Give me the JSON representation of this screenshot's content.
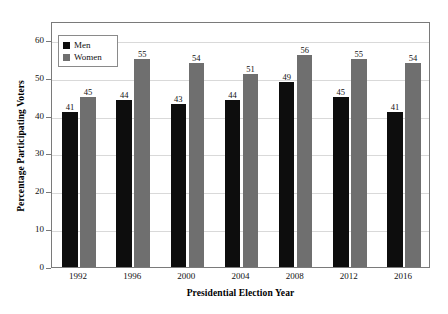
{
  "chart_data": {
    "type": "bar",
    "title": "",
    "xlabel": "Presidential Election Year",
    "ylabel": "Percentage Participating Voters",
    "categories": [
      "1992",
      "1996",
      "2000",
      "2004",
      "2008",
      "2012",
      "2016"
    ],
    "series": [
      {
        "name": "Men",
        "values": [
          41,
          44,
          43,
          44,
          49,
          45,
          41
        ],
        "color": "#0d0d0d"
      },
      {
        "name": "Women",
        "values": [
          45,
          55,
          54,
          51,
          56,
          55,
          54
        ],
        "color": "#6f6f6f"
      }
    ],
    "ylim": [
      0,
      65
    ],
    "yticks": [
      0,
      10,
      20,
      30,
      40,
      50,
      60
    ],
    "ytick_labels": [
      "0",
      "10",
      "20",
      "30",
      "40",
      "50",
      "60"
    ],
    "grid": true,
    "grid_axis": "y",
    "legend_position": "upper-left",
    "data_labels": true
  },
  "figure": {
    "caption": ""
  }
}
